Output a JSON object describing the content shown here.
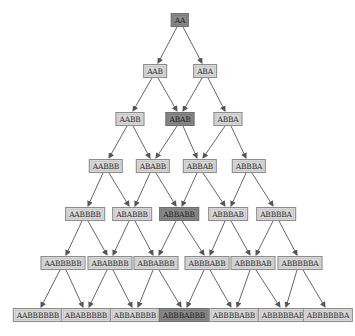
{
  "diagram": {
    "type": "tree",
    "highlight_color": "#8a8a8a",
    "node_color": "#d9d9d9",
    "edge_color": "#555555",
    "nodes": [
      {
        "id": "n0",
        "label": "AA",
        "x": 180,
        "y": 20,
        "hl": true
      },
      {
        "id": "n1",
        "label": "AAB",
        "x": 155,
        "y": 71,
        "hl": false
      },
      {
        "id": "n2",
        "label": "ABA",
        "x": 205,
        "y": 71,
        "hl": false
      },
      {
        "id": "n3",
        "label": "AABB",
        "x": 130,
        "y": 119,
        "hl": false
      },
      {
        "id": "n4",
        "label": "ABAB",
        "x": 180,
        "y": 119,
        "hl": true
      },
      {
        "id": "n5",
        "label": "ABBA",
        "x": 228,
        "y": 119,
        "hl": false
      },
      {
        "id": "n6",
        "label": "AABBB",
        "x": 106,
        "y": 166,
        "hl": false
      },
      {
        "id": "n7",
        "label": "ABABB",
        "x": 153,
        "y": 166,
        "hl": false
      },
      {
        "id": "n8",
        "label": "ABBAB",
        "x": 200,
        "y": 166,
        "hl": false
      },
      {
        "id": "n9",
        "label": "ABBBA",
        "x": 249,
        "y": 166,
        "hl": false
      },
      {
        "id": "n10",
        "label": "AABBBB",
        "x": 85,
        "y": 214,
        "hl": false
      },
      {
        "id": "n11",
        "label": "ABABBB",
        "x": 132,
        "y": 214,
        "hl": false
      },
      {
        "id": "n12",
        "label": "ABBABB",
        "x": 179,
        "y": 214,
        "hl": true
      },
      {
        "id": "n13",
        "label": "ABBBAB",
        "x": 228,
        "y": 214,
        "hl": false
      },
      {
        "id": "n14",
        "label": "ABBBBA",
        "x": 276,
        "y": 214,
        "hl": false
      },
      {
        "id": "n15",
        "label": "AABBBBB",
        "x": 63,
        "y": 263,
        "hl": false
      },
      {
        "id": "n16",
        "label": "ABABBBB",
        "x": 110,
        "y": 263,
        "hl": false
      },
      {
        "id": "n17",
        "label": "ABBABBB",
        "x": 156,
        "y": 263,
        "hl": false
      },
      {
        "id": "n18",
        "label": "ABBBABB",
        "x": 207,
        "y": 263,
        "hl": false
      },
      {
        "id": "n19",
        "label": "ABBBBAB",
        "x": 253,
        "y": 263,
        "hl": false
      },
      {
        "id": "n20",
        "label": "ABBBBBA",
        "x": 300,
        "y": 263,
        "hl": false
      },
      {
        "id": "n21",
        "label": "AABBBBBB",
        "x": 38,
        "y": 315,
        "hl": false
      },
      {
        "id": "n22",
        "label": "ABABBBBB",
        "x": 86,
        "y": 315,
        "hl": false
      },
      {
        "id": "n23",
        "label": "ABBABBBB",
        "x": 135,
        "y": 315,
        "hl": false
      },
      {
        "id": "n24",
        "label": "ABBBABBB",
        "x": 184,
        "y": 315,
        "hl": true
      },
      {
        "id": "n25",
        "label": "ABBBBABB",
        "x": 234,
        "y": 315,
        "hl": false
      },
      {
        "id": "n26",
        "label": "ABBBBBAB",
        "x": 283,
        "y": 315,
        "hl": false
      },
      {
        "id": "n27",
        "label": "ABBBBBBA",
        "x": 328,
        "y": 315,
        "hl": false
      }
    ],
    "edges": [
      [
        "n0",
        "n1"
      ],
      [
        "n0",
        "n2"
      ],
      [
        "n1",
        "n3"
      ],
      [
        "n1",
        "n4"
      ],
      [
        "n2",
        "n4"
      ],
      [
        "n2",
        "n5"
      ],
      [
        "n3",
        "n6"
      ],
      [
        "n3",
        "n7"
      ],
      [
        "n4",
        "n7"
      ],
      [
        "n4",
        "n8"
      ],
      [
        "n5",
        "n8"
      ],
      [
        "n5",
        "n9"
      ],
      [
        "n6",
        "n10"
      ],
      [
        "n6",
        "n11"
      ],
      [
        "n7",
        "n11"
      ],
      [
        "n7",
        "n12"
      ],
      [
        "n8",
        "n12"
      ],
      [
        "n8",
        "n13"
      ],
      [
        "n9",
        "n13"
      ],
      [
        "n9",
        "n14"
      ],
      [
        "n10",
        "n15"
      ],
      [
        "n10",
        "n16"
      ],
      [
        "n11",
        "n16"
      ],
      [
        "n11",
        "n17"
      ],
      [
        "n12",
        "n17"
      ],
      [
        "n12",
        "n18"
      ],
      [
        "n13",
        "n18"
      ],
      [
        "n13",
        "n19"
      ],
      [
        "n14",
        "n19"
      ],
      [
        "n14",
        "n20"
      ],
      [
        "n15",
        "n21"
      ],
      [
        "n15",
        "n22"
      ],
      [
        "n16",
        "n22"
      ],
      [
        "n16",
        "n23"
      ],
      [
        "n17",
        "n23"
      ],
      [
        "n17",
        "n24"
      ],
      [
        "n18",
        "n24"
      ],
      [
        "n18",
        "n25"
      ],
      [
        "n19",
        "n25"
      ],
      [
        "n19",
        "n26"
      ],
      [
        "n20",
        "n26"
      ],
      [
        "n20",
        "n27"
      ]
    ]
  }
}
